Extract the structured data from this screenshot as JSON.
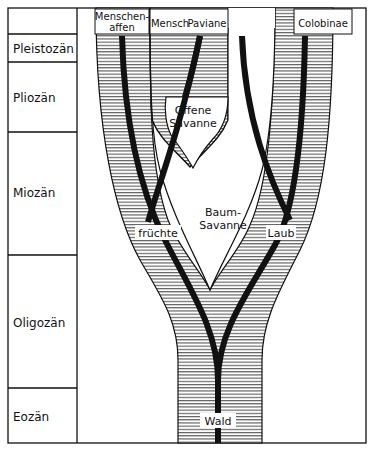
{
  "eras": [
    {
      "label": "",
      "y0": 8,
      "y1": 34
    },
    {
      "label": "Pleistozän",
      "y0": 34,
      "y1": 62
    },
    {
      "label": "Pliozän",
      "y0": 62,
      "y1": 132
    },
    {
      "label": "Miozän",
      "y0": 132,
      "y1": 255
    },
    {
      "label": "Oligozän",
      "y0": 255,
      "y1": 388
    },
    {
      "label": "Eozän",
      "y0": 388,
      "y1": 443
    }
  ],
  "taxa": {
    "menschenaffen_1": "Menschen-",
    "menschenaffen_2": "affen",
    "mensch": "Mensch",
    "paviane": "Paviane",
    "colobinae": "Colobinae"
  },
  "habitats": {
    "offene_1": "Offene",
    "offene_2": "Savanne",
    "baum_1": "Baum-",
    "baum_2": "Savanne",
    "wald": "Wald"
  },
  "diets": {
    "fruechte": "früchte",
    "laub": "Laub"
  },
  "colors": {
    "line": "#111111",
    "hatch": "#333333",
    "bg": "#ffffff"
  }
}
